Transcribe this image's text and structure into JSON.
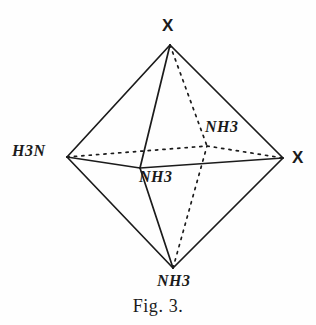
{
  "figure": {
    "caption": "Fig. 3.",
    "stroke_color": "#1b1b1b",
    "background_color": "#fefefe"
  },
  "diagram": {
    "shape": "octahedron",
    "vertices": [
      {
        "id": "top",
        "label": "X",
        "label_kind": "halide",
        "x": 170,
        "y": 45,
        "label_x": 168,
        "label_y": 26
      },
      {
        "id": "left",
        "label": "H3N",
        "label_kind": "ammine",
        "x": 67,
        "y": 157,
        "label_x": 36,
        "label_y": 155
      },
      {
        "id": "right",
        "label": "X",
        "label_kind": "halide",
        "x": 283,
        "y": 158,
        "label_x": 297,
        "label_y": 160
      },
      {
        "id": "front",
        "label": "NH3",
        "label_kind": "ammine",
        "x": 140,
        "y": 168,
        "label_x": 162,
        "label_y": 181
      },
      {
        "id": "back",
        "label": "NH3",
        "label_kind": "ammine",
        "x": 207,
        "y": 146,
        "label_x": 229,
        "label_y": 130
      },
      {
        "id": "bottom",
        "label": "NH3",
        "label_kind": "ammine",
        "x": 173,
        "y": 268,
        "label_x": 185,
        "label_y": 285
      }
    ],
    "edges": [
      {
        "from": "top",
        "to": "left",
        "style": "solid"
      },
      {
        "from": "top",
        "to": "right",
        "style": "solid"
      },
      {
        "from": "top",
        "to": "front",
        "style": "solid"
      },
      {
        "from": "top",
        "to": "back",
        "style": "dotted"
      },
      {
        "from": "bottom",
        "to": "left",
        "style": "solid"
      },
      {
        "from": "bottom",
        "to": "right",
        "style": "solid"
      },
      {
        "from": "bottom",
        "to": "front",
        "style": "solid"
      },
      {
        "from": "bottom",
        "to": "back",
        "style": "dotted"
      },
      {
        "from": "left",
        "to": "front",
        "style": "solid"
      },
      {
        "from": "front",
        "to": "right",
        "style": "solid"
      },
      {
        "from": "left",
        "to": "back",
        "style": "dotted"
      },
      {
        "from": "back",
        "to": "right",
        "style": "dotted"
      }
    ]
  },
  "labels": {
    "top_x": "X",
    "right_x": "X",
    "left_h3n": "H3N",
    "back_nh3": "NH3",
    "front_nh3": "NH3",
    "bottom_nh3": "NH3"
  }
}
